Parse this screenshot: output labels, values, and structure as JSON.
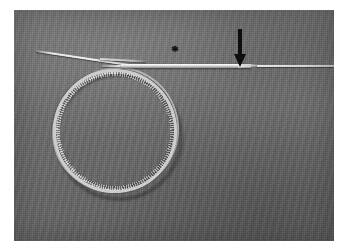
{
  "figure": {
    "domain": "Natural-Image",
    "caption_visible": false,
    "plate": {
      "border_color": "#ffffff",
      "background_color": "#6b6b6b",
      "background_label": "gray fabric surgical drape"
    },
    "objects": [
      {
        "name": "guidewire-coil",
        "label": "coiled guidewire",
        "shape": "circular loop",
        "color": "#cfcfcf"
      },
      {
        "name": "wire-tail",
        "label": "guidewire free tail",
        "shape": "thin straight strand",
        "color": "#e8e8e8"
      },
      {
        "name": "needle-shaft",
        "label": "needle / introducer shaft",
        "shape": "horizontal tapered rod",
        "color": "#e2e2e2"
      }
    ],
    "annotations": [
      {
        "name": "arrow-annotation",
        "glyph": "↓",
        "label": "downward arrow",
        "color": "#0b0b0b",
        "points_to": "needle taper / junction point"
      },
      {
        "name": "asterisk-annotation",
        "glyph": "*",
        "label": "asterisk marker",
        "color": "#0d0d0d",
        "points_to": "needle hub segment"
      }
    ]
  }
}
